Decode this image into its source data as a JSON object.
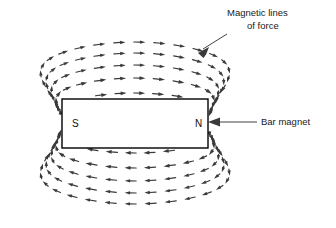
{
  "figure": {
    "title_absent": true,
    "width": 336,
    "height": 228,
    "background_color": "#ffffff",
    "ink_color": "#3a3a3a",
    "outline_color": "#000000"
  },
  "annotations": {
    "magnetic_lines": {
      "line1": "Magnetic lines",
      "line2": "of force",
      "leader_from": [
        228,
        34
      ],
      "leader_to": [
        199,
        53
      ],
      "arrow_head": "down-left"
    },
    "bar_magnet": {
      "label": "Bar magnet",
      "leader_from": [
        318,
        122
      ],
      "leader_to": [
        210,
        122
      ],
      "arrow_head": "left"
    }
  },
  "magnet": {
    "x": 62,
    "y": 99,
    "width": 146,
    "height": 49,
    "south_pole_label": "S",
    "north_pole_label": "N",
    "south_label_pos": [
      72,
      126
    ],
    "north_label_pos": [
      196,
      126
    ]
  },
  "chart_data": {
    "type": "vector-field",
    "field_direction": "from N (right) to S (left) outside the magnet",
    "loop_count": 5,
    "loops": [
      {
        "rx": 88,
        "ry": 30,
        "segments": 30
      },
      {
        "rx": 104,
        "ry": 45,
        "segments": 34
      },
      {
        "rx": 118,
        "ry": 58,
        "segments": 38
      },
      {
        "rx": 132,
        "ry": 70,
        "segments": 42
      },
      {
        "rx": 146,
        "ry": 81,
        "segments": 46
      }
    ],
    "center": [
      135,
      123
    ],
    "pole_gap": 73,
    "xlabel": "",
    "ylabel": ""
  }
}
